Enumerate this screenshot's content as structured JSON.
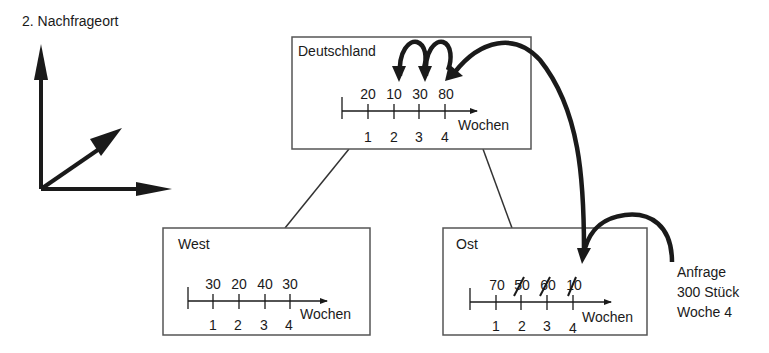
{
  "title": "2. Nachfrageort",
  "axis_unit": "Wochen",
  "week_labels": [
    "1",
    "2",
    "3",
    "4"
  ],
  "regions": {
    "deutschland": {
      "name": "Deutschland",
      "values": [
        "20",
        "10",
        "30",
        "80"
      ]
    },
    "west": {
      "name": "West",
      "values": [
        "30",
        "20",
        "40",
        "30"
      ]
    },
    "ost": {
      "name": "Ost",
      "values": [
        "70",
        "50",
        "60",
        "10"
      ],
      "struck": [
        false,
        true,
        true,
        true
      ]
    }
  },
  "request": {
    "line1": "Anfrage",
    "line2": "300 Stück",
    "line3": "Woche 4"
  },
  "colors": {
    "ink": "#1a1a1a",
    "box": "#555555"
  }
}
